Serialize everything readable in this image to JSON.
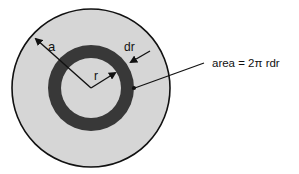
{
  "diagram": {
    "labels": {
      "outer_radius": "a",
      "inner_radius": "r",
      "thickness": "dr",
      "area_formula": "area = 2π rdr"
    },
    "colors": {
      "outer_disk": "#d6d6d6",
      "annulus": "#383838",
      "inner_disk": "#d6d6d6",
      "stroke": "#111111",
      "background": "#ffffff"
    }
  }
}
